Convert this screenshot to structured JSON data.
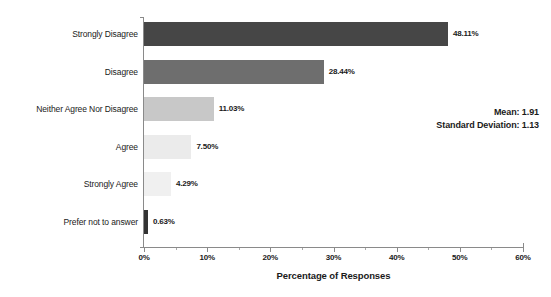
{
  "chart_data": {
    "type": "bar",
    "orientation": "horizontal",
    "title": "",
    "xlabel": "Percentage of Responses",
    "ylabel": "",
    "xlim": [
      0,
      60
    ],
    "grid": false,
    "legend": null,
    "categories": [
      "Strongly Disagree",
      "Disagree",
      "Neither Agree Nor Disagree",
      "Agree",
      "Strongly Agree",
      "Prefer not to answer"
    ],
    "values": [
      48.11,
      28.44,
      11.03,
      7.5,
      4.29,
      0.63
    ],
    "value_labels": [
      "48.11%",
      "28.44%",
      "11.03%",
      "7.50%",
      "4.29%",
      "0.63%"
    ],
    "bar_colors": [
      "#464646",
      "#6e6e6e",
      "#c8c8c8",
      "#ebebeb",
      "#f0f0f0",
      "#333333"
    ],
    "xticks": [
      0,
      10,
      20,
      30,
      40,
      50,
      60
    ],
    "xtick_labels": [
      "0%",
      "10%",
      "20%",
      "30%",
      "40%",
      "50%",
      "60%"
    ],
    "xminor_ticks": [
      5,
      15,
      25,
      35,
      45,
      55
    ],
    "annotations": {
      "mean_label": "Mean: 1.91",
      "std_label": "Standard Deviation: 1.13",
      "mean": 1.91,
      "standard_deviation": 1.13
    }
  },
  "colors": {
    "axis": "#8a8a8a",
    "text": "#1a1a1a",
    "background": "#ffffff"
  }
}
